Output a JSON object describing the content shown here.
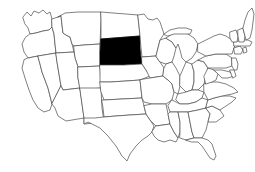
{
  "figure": {
    "subtitle": "South Dakota highlighted",
    "caption": "",
    "background_color": "#ffffff",
    "border_color": "#4a4a4a",
    "highlight_color": "#000000",
    "default_state_fill": "#ffffff",
    "width_px": 255,
    "height_px": 172
  },
  "map": {
    "projection_note": "contiguous United States outline",
    "highlighted_state": "South Dakota",
    "highlighted_state_abbr": "SD",
    "states_shown_count": 48,
    "states": [
      {
        "abbr": "WA",
        "name": "Washington",
        "highlighted": false
      },
      {
        "abbr": "OR",
        "name": "Oregon",
        "highlighted": false
      },
      {
        "abbr": "CA",
        "name": "California",
        "highlighted": false
      },
      {
        "abbr": "NV",
        "name": "Nevada",
        "highlighted": false
      },
      {
        "abbr": "ID",
        "name": "Idaho",
        "highlighted": false
      },
      {
        "abbr": "MT",
        "name": "Montana",
        "highlighted": false
      },
      {
        "abbr": "WY",
        "name": "Wyoming",
        "highlighted": false
      },
      {
        "abbr": "UT",
        "name": "Utah",
        "highlighted": false
      },
      {
        "abbr": "AZ",
        "name": "Arizona",
        "highlighted": false
      },
      {
        "abbr": "CO",
        "name": "Colorado",
        "highlighted": false
      },
      {
        "abbr": "NM",
        "name": "New Mexico",
        "highlighted": false
      },
      {
        "abbr": "ND",
        "name": "North Dakota",
        "highlighted": false
      },
      {
        "abbr": "SD",
        "name": "South Dakota",
        "highlighted": true
      },
      {
        "abbr": "NE",
        "name": "Nebraska",
        "highlighted": false
      },
      {
        "abbr": "KS",
        "name": "Kansas",
        "highlighted": false
      },
      {
        "abbr": "OK",
        "name": "Oklahoma",
        "highlighted": false
      },
      {
        "abbr": "TX",
        "name": "Texas",
        "highlighted": false
      },
      {
        "abbr": "MN",
        "name": "Minnesota",
        "highlighted": false
      },
      {
        "abbr": "IA",
        "name": "Iowa",
        "highlighted": false
      },
      {
        "abbr": "MO",
        "name": "Missouri",
        "highlighted": false
      },
      {
        "abbr": "AR",
        "name": "Arkansas",
        "highlighted": false
      },
      {
        "abbr": "LA",
        "name": "Louisiana",
        "highlighted": false
      },
      {
        "abbr": "WI",
        "name": "Wisconsin",
        "highlighted": false
      },
      {
        "abbr": "IL",
        "name": "Illinois",
        "highlighted": false
      },
      {
        "abbr": "MI",
        "name": "Michigan",
        "highlighted": false
      },
      {
        "abbr": "IN",
        "name": "Indiana",
        "highlighted": false
      },
      {
        "abbr": "OH",
        "name": "Ohio",
        "highlighted": false
      },
      {
        "abbr": "KY",
        "name": "Kentucky",
        "highlighted": false
      },
      {
        "abbr": "TN",
        "name": "Tennessee",
        "highlighted": false
      },
      {
        "abbr": "MS",
        "name": "Mississippi",
        "highlighted": false
      },
      {
        "abbr": "AL",
        "name": "Alabama",
        "highlighted": false
      },
      {
        "abbr": "GA",
        "name": "Georgia",
        "highlighted": false
      },
      {
        "abbr": "FL",
        "name": "Florida",
        "highlighted": false
      },
      {
        "abbr": "SC",
        "name": "South Carolina",
        "highlighted": false
      },
      {
        "abbr": "NC",
        "name": "North Carolina",
        "highlighted": false
      },
      {
        "abbr": "VA",
        "name": "Virginia",
        "highlighted": false
      },
      {
        "abbr": "WV",
        "name": "West Virginia",
        "highlighted": false
      },
      {
        "abbr": "MD",
        "name": "Maryland",
        "highlighted": false
      },
      {
        "abbr": "DE",
        "name": "Delaware",
        "highlighted": false
      },
      {
        "abbr": "PA",
        "name": "Pennsylvania",
        "highlighted": false
      },
      {
        "abbr": "NJ",
        "name": "New Jersey",
        "highlighted": false
      },
      {
        "abbr": "NY",
        "name": "New York",
        "highlighted": false
      },
      {
        "abbr": "CT",
        "name": "Connecticut",
        "highlighted": false
      },
      {
        "abbr": "RI",
        "name": "Rhode Island",
        "highlighted": false
      },
      {
        "abbr": "MA",
        "name": "Massachusetts",
        "highlighted": false
      },
      {
        "abbr": "VT",
        "name": "Vermont",
        "highlighted": false
      },
      {
        "abbr": "NH",
        "name": "New Hampshire",
        "highlighted": false
      },
      {
        "abbr": "ME",
        "name": "Maine",
        "highlighted": false
      }
    ]
  }
}
